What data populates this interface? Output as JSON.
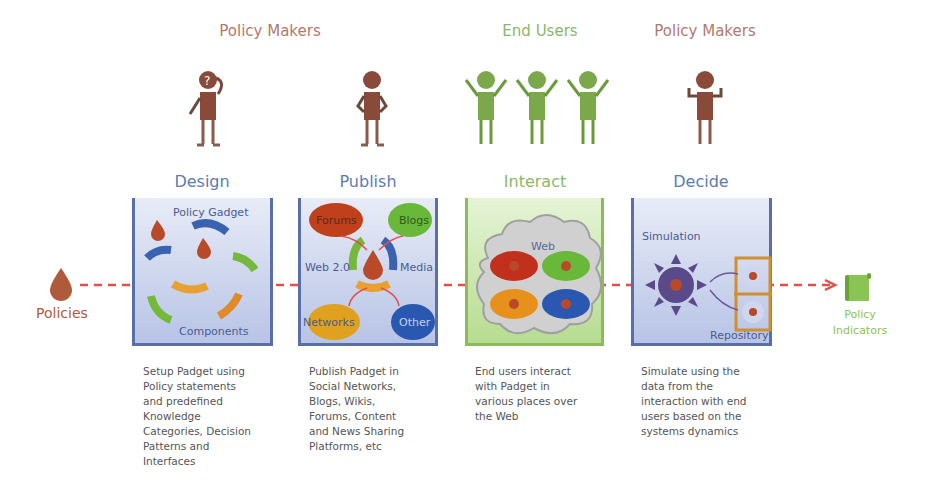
{
  "roles": [
    {
      "label": "Policy Makers",
      "color": "#b07a6e"
    },
    {
      "label": "End Users",
      "color": "#8ab86a"
    },
    {
      "label": "Policy Makers",
      "color": "#b07a6e"
    }
  ],
  "stages": [
    {
      "title": "Design",
      "title_color": "#5b7bb5",
      "box_labels": [
        "Policy Gadget",
        "Components"
      ],
      "description": [
        "Setup Padget using",
        "Policy statements",
        "and predefined",
        "Knowledge",
        "Categories, Decision",
        "Patterns and",
        "Interfaces"
      ]
    },
    {
      "title": "Publish",
      "title_color": "#5b7bb5",
      "box_labels": [
        "Forums",
        "Blogs",
        "Web 2.0",
        "Media",
        "Networks",
        "Other"
      ],
      "description": [
        "Publish Padget in",
        "Social Networks,",
        "Blogs, Wikis,",
        "Forums, Content",
        "and News Sharing",
        "Platforms, etc"
      ]
    },
    {
      "title": "Interact",
      "title_color": "#8ab86a",
      "box_labels": [
        "Web"
      ],
      "description": [
        "End users interact",
        "with Padget in",
        "various places over",
        "the Web"
      ]
    },
    {
      "title": "Decide",
      "title_color": "#5b7bb5",
      "box_labels": [
        "Simulation",
        "Repository"
      ],
      "description": [
        "Simulate using the",
        "data from the",
        "interaction with end",
        "users based on the",
        "systems dynamics"
      ]
    }
  ],
  "input": {
    "label": "Policies",
    "icon": "drop-icon",
    "color": "#b05a3c"
  },
  "output": {
    "label_line1": "Policy",
    "label_line2": "Indicators",
    "icon": "scroll-icon",
    "color": "#8ac454"
  },
  "colors": {
    "arrow": "#e0504a",
    "policy_maker": "#8a4a3a",
    "end_user": "#7aa84a",
    "box_border_blue": "#5a6ea8",
    "box_border_green": "#8cbc5a"
  }
}
